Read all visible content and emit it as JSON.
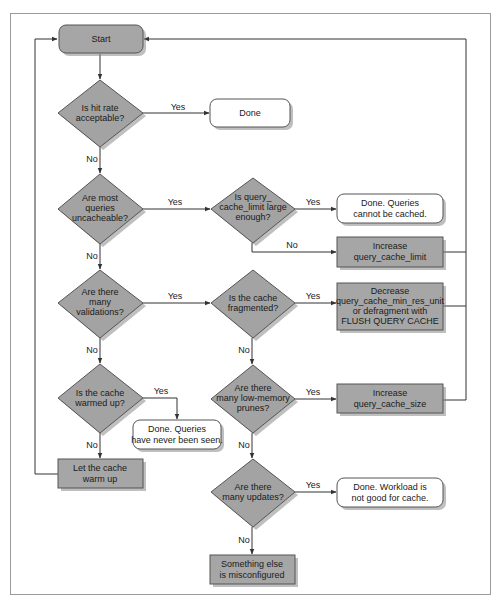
{
  "colors": {
    "decision_fill": "#a3a3a3",
    "process_fill": "#a6a6a6",
    "terminal_fill": "#ffffff",
    "stroke": "#555555",
    "line": "#333333",
    "frame": "#9a9a9a"
  },
  "nodes": {
    "start": {
      "type": "start",
      "lines": [
        "Start"
      ]
    },
    "hit_rate": {
      "type": "decision",
      "lines": [
        "Is hit rate",
        "acceptable?"
      ]
    },
    "done": {
      "type": "terminal",
      "lines": [
        "Done"
      ]
    },
    "uncacheable": {
      "type": "decision",
      "lines": [
        "Are most",
        "queries",
        "uncacheable?"
      ]
    },
    "limit_large": {
      "type": "decision",
      "lines": [
        "Is query_",
        "cache_limit large",
        "enough?"
      ]
    },
    "done_cannot_cache": {
      "type": "terminal",
      "lines": [
        "Done. Queries",
        "cannot be cached."
      ]
    },
    "increase_limit": {
      "type": "process",
      "lines": [
        "Increase",
        "query_cache_limit"
      ]
    },
    "validations": {
      "type": "decision",
      "lines": [
        "Are there",
        "many",
        "validations?"
      ]
    },
    "fragmented": {
      "type": "decision",
      "lines": [
        "Is the cache",
        "fragmented?"
      ]
    },
    "decrease_unit": {
      "type": "process",
      "lines": [
        "Decrease",
        "query_cache_min_res_unit",
        "or defragment with",
        "FLUSH QUERY CACHE"
      ]
    },
    "warmed_up": {
      "type": "decision",
      "lines": [
        "Is the cache",
        "warmed up?"
      ]
    },
    "done_never_seen": {
      "type": "terminal",
      "lines": [
        "Done. Queries",
        "have never been seen."
      ]
    },
    "let_warm": {
      "type": "process",
      "lines": [
        "Let the cache",
        "warm up"
      ]
    },
    "low_memory": {
      "type": "decision",
      "lines": [
        "Are there",
        "many low-memory",
        "prunes?"
      ]
    },
    "increase_size": {
      "type": "process",
      "lines": [
        "Increase",
        "query_cache_size"
      ]
    },
    "many_updates": {
      "type": "decision",
      "lines": [
        "Are there",
        "many updates?"
      ]
    },
    "done_workload": {
      "type": "terminal",
      "lines": [
        "Done. Workload is",
        "not good for cache."
      ]
    },
    "misconfigured": {
      "type": "process",
      "lines": [
        "Something else",
        "is misconfigured"
      ]
    }
  },
  "edges": [
    {
      "from": "start",
      "to": "hit_rate",
      "label": ""
    },
    {
      "from": "hit_rate",
      "to": "done",
      "label": "Yes"
    },
    {
      "from": "hit_rate",
      "to": "uncacheable",
      "label": "No"
    },
    {
      "from": "uncacheable",
      "to": "limit_large",
      "label": "Yes"
    },
    {
      "from": "uncacheable",
      "to": "validations",
      "label": "No"
    },
    {
      "from": "limit_large",
      "to": "done_cannot_cache",
      "label": "Yes"
    },
    {
      "from": "limit_large",
      "to": "increase_limit",
      "label": "No"
    },
    {
      "from": "increase_limit",
      "to": "start",
      "label": ""
    },
    {
      "from": "validations",
      "to": "fragmented",
      "label": "Yes"
    },
    {
      "from": "validations",
      "to": "warmed_up",
      "label": "No"
    },
    {
      "from": "fragmented",
      "to": "decrease_unit",
      "label": "Yes"
    },
    {
      "from": "fragmented",
      "to": "low_memory",
      "label": "No"
    },
    {
      "from": "decrease_unit",
      "to": "start",
      "label": ""
    },
    {
      "from": "warmed_up",
      "to": "done_never_seen",
      "label": "Yes"
    },
    {
      "from": "warmed_up",
      "to": "let_warm",
      "label": "No"
    },
    {
      "from": "let_warm",
      "to": "start",
      "label": ""
    },
    {
      "from": "low_memory",
      "to": "increase_size",
      "label": "Yes"
    },
    {
      "from": "low_memory",
      "to": "many_updates",
      "label": "No"
    },
    {
      "from": "increase_size",
      "to": "start",
      "label": ""
    },
    {
      "from": "many_updates",
      "to": "done_workload",
      "label": "Yes"
    },
    {
      "from": "many_updates",
      "to": "misconfigured",
      "label": "No"
    }
  ],
  "labels": {
    "yes": "Yes",
    "no": "No"
  }
}
